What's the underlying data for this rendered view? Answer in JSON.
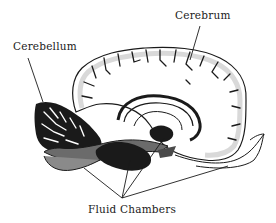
{
  "figure": {
    "labels": {
      "cerebrum": "Cerebrum",
      "cerebellum": "Cerebellum",
      "fluid_chambers": "Fluid Chambers"
    },
    "colors": {
      "ink": "#1a1a1a",
      "shading": "#d9d9d9",
      "background": "#ffffff"
    }
  }
}
